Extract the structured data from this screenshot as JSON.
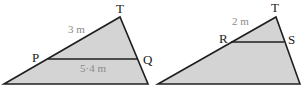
{
  "colors": {
    "fill": "#d4d4d4",
    "stroke": "#1f1f1f",
    "vertex_label": "#1a1a1a",
    "length_label": "#8a8a8a"
  },
  "left_figure": {
    "vertices": {
      "apex": "T",
      "left_point": "P",
      "right_point": "Q"
    },
    "lengths": {
      "TP": "3 m",
      "PQ": "5·4 m"
    }
  },
  "right_figure": {
    "vertices": {
      "apex": "T",
      "left_point": "R",
      "right_point": "S"
    },
    "lengths": {
      "TR": "2 m"
    }
  }
}
